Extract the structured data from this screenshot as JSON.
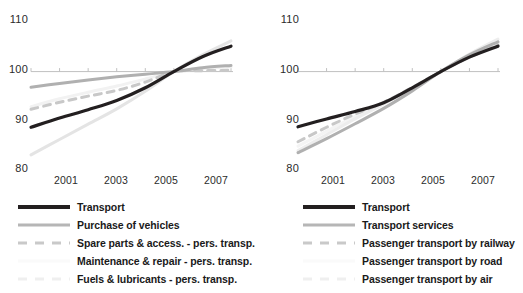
{
  "chart_data": [
    {
      "type": "line",
      "panel": "left",
      "title": "",
      "xlabel": "",
      "ylabel": "",
      "x": [
        2000,
        2001,
        2002,
        2003,
        2004,
        2005,
        2006,
        2007
      ],
      "xlim": [
        2000,
        2007
      ],
      "ylim": [
        78,
        112
      ],
      "yticks": [
        80,
        90,
        100,
        110
      ],
      "xticks": [
        2001,
        2003,
        2005,
        2007
      ],
      "grid": false,
      "baseline": 100,
      "legend_position": "below",
      "series": [
        {
          "name": "Transport",
          "color": "#231f20",
          "style": "solid",
          "width": 3.2,
          "values": [
            87.3,
            89.4,
            91.3,
            93.4,
            96.3,
            100.0,
            103.4,
            105.8
          ]
        },
        {
          "name": "Purchase of vehicles",
          "color": "#b0b0b0",
          "style": "solid",
          "width": 3.0,
          "values": [
            96.4,
            97.3,
            98.1,
            98.8,
            99.4,
            100.0,
            100.9,
            101.4
          ]
        },
        {
          "name": "Spare parts & access. - pers. transp.",
          "color": "#c8c8c8",
          "style": "dashed",
          "width": 3.0,
          "values": [
            91.4,
            93.0,
            94.4,
            95.7,
            97.6,
            100.0,
            100.2,
            100.3
          ]
        },
        {
          "name": "Maintenance & repair - pers. transp.",
          "color": "#f2f2f2",
          "style": "solid",
          "width": 3.0,
          "values": [
            92.0,
            93.8,
            95.3,
            96.7,
            98.3,
            100.0,
            100.7,
            101.1
          ]
        },
        {
          "name": "Fuels & lubricants - pers. transp.",
          "color": "#e4e4e4",
          "style": "solid",
          "width": 3.0,
          "values": [
            81.0,
            84.5,
            88.0,
            91.5,
            95.5,
            100.0,
            103.8,
            107.0
          ]
        }
      ]
    },
    {
      "type": "line",
      "panel": "right",
      "title": "",
      "xlabel": "",
      "ylabel": "",
      "x": [
        2000,
        2001,
        2002,
        2003,
        2004,
        2005,
        2006,
        2007
      ],
      "xlim": [
        2000,
        2007
      ],
      "ylim": [
        78,
        112
      ],
      "yticks": [
        80,
        90,
        100,
        110
      ],
      "xticks": [
        2001,
        2003,
        2005,
        2007
      ],
      "grid": false,
      "baseline": 100,
      "legend_position": "below",
      "series": [
        {
          "name": "Transport",
          "color": "#231f20",
          "style": "solid",
          "width": 3.2,
          "values": [
            87.4,
            89.2,
            90.9,
            92.9,
            96.3,
            100.0,
            103.3,
            105.8
          ]
        },
        {
          "name": "Transport services",
          "color": "#b0b0b0",
          "style": "solid",
          "width": 3.0,
          "values": [
            81.5,
            84.7,
            88.1,
            91.6,
            95.6,
            100.0,
            103.8,
            106.8
          ]
        },
        {
          "name": "Passenger transport by railway",
          "color": "#c8c8c8",
          "style": "dashed",
          "width": 3.0,
          "values": [
            84.0,
            87.3,
            90.3,
            93.0,
            96.4,
            100.0,
            103.3,
            106.0
          ]
        },
        {
          "name": "Passenger transport by road",
          "color": "#f4f4f4",
          "style": "solid",
          "width": 3.0,
          "values": [
            83.0,
            86.4,
            89.8,
            92.9,
            96.3,
            100.0,
            103.4,
            106.2
          ]
        },
        {
          "name": "Passenger transport by air",
          "color": "#ededed",
          "style": "solid",
          "width": 3.0,
          "values": [
            82.0,
            85.6,
            89.2,
            92.6,
            96.2,
            100.0,
            104.0,
            107.4
          ]
        }
      ]
    }
  ],
  "left_panel": {
    "yticks": [
      {
        "label": "110"
      },
      {
        "label": "100"
      },
      {
        "label": "90"
      },
      {
        "label": "80"
      }
    ],
    "xticks": [
      {
        "label": "2001"
      },
      {
        "label": "2003"
      },
      {
        "label": "2005"
      },
      {
        "label": "2007"
      }
    ],
    "legend": [
      {
        "label": "Transport"
      },
      {
        "label": "Purchase of vehicles"
      },
      {
        "label": "Spare parts & access. - pers. transp."
      },
      {
        "label": "Maintenance & repair - pers. transp."
      },
      {
        "label": "Fuels & lubricants - pers. transp."
      }
    ]
  },
  "right_panel": {
    "yticks": [
      {
        "label": "110"
      },
      {
        "label": "100"
      },
      {
        "label": "90"
      },
      {
        "label": "80"
      }
    ],
    "xticks": [
      {
        "label": "2001"
      },
      {
        "label": "2003"
      },
      {
        "label": "2005"
      },
      {
        "label": "2007"
      }
    ],
    "legend": [
      {
        "label": "Transport"
      },
      {
        "label": "Transport services"
      },
      {
        "label": "Passenger transport by railway"
      },
      {
        "label": "Passenger transport by road"
      },
      {
        "label": "Passenger transport by air"
      }
    ]
  }
}
